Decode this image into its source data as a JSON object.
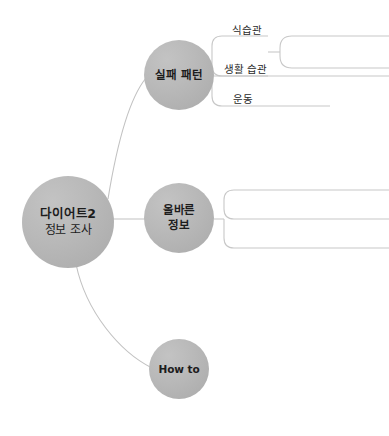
{
  "diagram": {
    "type": "mind-map",
    "root": {
      "line1": "다이어트2",
      "line2": "정보 조사"
    },
    "branches": [
      {
        "id": "failure-pattern",
        "line1": "실패 패턴",
        "line2": "",
        "leaves": [
          {
            "label": "식습관",
            "has_nested_bracket": true
          },
          {
            "label": "생활 습관",
            "has_nested_bracket": false
          },
          {
            "label": "운동",
            "has_nested_bracket": false
          }
        ]
      },
      {
        "id": "correct-info",
        "line1": "올바른",
        "line2": "정보",
        "leaves": []
      },
      {
        "id": "how-to",
        "line1": "How to",
        "line2": "",
        "leaves": []
      }
    ]
  },
  "style": {
    "node_fill": "#b5b5b5",
    "connector_color": "#c8c8c8",
    "text_color": "#1c1c1c",
    "background": "#ffffff"
  }
}
